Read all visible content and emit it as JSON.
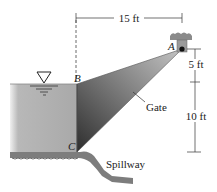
{
  "diagram": {
    "dimensions": {
      "horizontal": "15 ft",
      "vertical_top": "5 ft",
      "vertical_bottom": "10 ft"
    },
    "points": {
      "A": "A",
      "B": "B",
      "C": "C"
    },
    "labels": {
      "gate": "Gate",
      "spillway": "Spillway"
    },
    "colors": {
      "water_light": "#c9c9c9",
      "water_dark": "#9a9a9a",
      "gate_light": "#a8a8a8",
      "gate_dark": "#3a3a3a",
      "ground": "#7a7a7a",
      "line": "#333333"
    }
  }
}
